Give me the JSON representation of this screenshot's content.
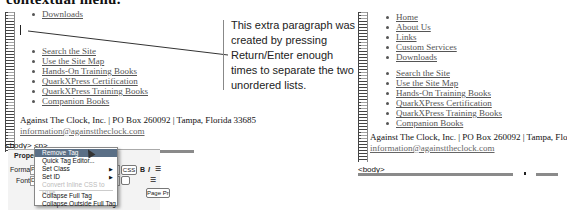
{
  "heading": "contextual menu.",
  "left_panel": {
    "top_partial_item": "Downloads",
    "list_items": [
      "Search the Site",
      "Use the Site Map",
      "Hands-On Training Books",
      "QuarkXPress Certification",
      "QuarkXPress Training Books",
      "Companion Books"
    ],
    "footer_line": "Against The Clock, Inc. | PO Box 260092 | Tampa, Florida 33685",
    "footer_email": "information@againsttheclock.com",
    "tag_selector": "<body> <p>"
  },
  "context_menu": {
    "items": [
      {
        "label": "Remove Tag",
        "state": "selected"
      },
      {
        "label": "Quick Tag Editor...",
        "state": "normal"
      },
      {
        "label": "Set Class",
        "state": "normal",
        "submenu": true
      },
      {
        "label": "Set ID",
        "state": "normal",
        "submenu": true
      },
      {
        "label": "Convert Inline CSS to Rule",
        "state": "disabled"
      },
      {
        "label": "Collapse Full Tag",
        "state": "normal"
      },
      {
        "label": "Collapse Outside Full Tag",
        "state": "normal"
      }
    ]
  },
  "property_inspector": {
    "title": "Properties",
    "format_label": "Format",
    "format_value": "P",
    "font_label": "Font",
    "font_value": "D",
    "css_button": "CSS",
    "bold_button": "B",
    "italic_button": "I",
    "page_properties_button": "Page Prop"
  },
  "callout": {
    "text": "This extra paragraph was created by pressing Return/Enter enough times to separate the two unordered lists."
  },
  "right_panel": {
    "list1": [
      "Home",
      "About Us",
      "Links",
      "Custom Services",
      "Downloads"
    ],
    "list2": [
      "Search the Site",
      "Use the Site Map",
      "Hands-On Training Books",
      "QuarkXPress Certification",
      "QuarkXPress Training Books",
      "Companion Books"
    ],
    "footer_line": "Against The Clock, Inc. | PO Box 260092 | Tampa, Florida 33685",
    "footer_email": "information@againsttheclock.com",
    "tag_selector": "<body>"
  }
}
